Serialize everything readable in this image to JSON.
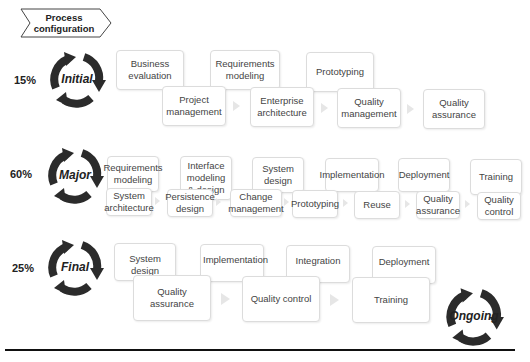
{
  "header": {
    "label": "Process configuration"
  },
  "phases": [
    {
      "name": "Initial",
      "percent": "15%",
      "top_row": [
        "Business evaluation",
        "Requirements modeling",
        "Prototyping"
      ],
      "bottom_row": [
        "Project management",
        "Enterprise architecture",
        "Quality management",
        "Quality assurance"
      ]
    },
    {
      "name": "Major",
      "percent": "60%",
      "top_row": [
        "Requirements modeling",
        "Interface modeling & design",
        "System design",
        "Implementation",
        "Deployment",
        "Training"
      ],
      "bottom_row": [
        "System architecture",
        "Persistence design",
        "Change management",
        "Prototyping",
        "Reuse",
        "Quality assurance",
        "Quality control"
      ]
    },
    {
      "name": "Final",
      "percent": "25%",
      "top_row": [
        "System design",
        "Implementation",
        "Integration",
        "Deployment"
      ],
      "bottom_row": [
        "Quality assurance",
        "Quality control",
        "Training"
      ]
    }
  ],
  "ongoing": {
    "name": "Ongoing"
  },
  "colors": {
    "cycle_arrow": "#2b2b2b",
    "box_border": "#dcdcdc",
    "connector_arrow": "#e6e6e6"
  }
}
